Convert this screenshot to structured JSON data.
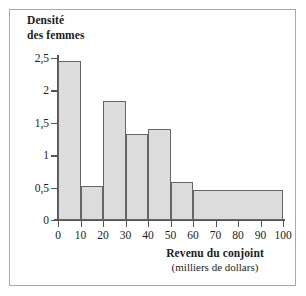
{
  "chart_data": {
    "type": "bar",
    "title": "",
    "subtitle": "",
    "ylabel": "Densité des femmes",
    "ylabel_lines": [
      "Densité",
      "des femmes"
    ],
    "xlabel": "Revenu du conjoint",
    "xlabel_sub": "(milliers de dollars)",
    "grid": false,
    "legend": null,
    "xlim": [
      0,
      100
    ],
    "ylim": [
      0,
      2.5
    ],
    "xticks": [
      0,
      10,
      20,
      30,
      40,
      50,
      60,
      70,
      80,
      90,
      100
    ],
    "xtick_labels": [
      "0",
      "10",
      "20",
      "30",
      "40",
      "50",
      "60",
      "70",
      "80",
      "90",
      "100"
    ],
    "yticks": [
      0,
      0.5,
      1,
      1.5,
      2,
      2.5
    ],
    "ytick_labels": [
      "0",
      "0,5",
      "1",
      "1,5",
      "2",
      "2,5"
    ],
    "bin_edges": [
      0,
      10,
      20,
      30,
      40,
      50,
      60,
      100
    ],
    "bars": [
      {
        "label": "0-10",
        "x0": 0,
        "x1": 10,
        "value": 2.45
      },
      {
        "label": "10-20",
        "x0": 10,
        "x1": 20,
        "value": 0.52
      },
      {
        "label": "20-30",
        "x0": 20,
        "x1": 30,
        "value": 1.84
      },
      {
        "label": "30-40",
        "x0": 30,
        "x1": 40,
        "value": 1.33
      },
      {
        "label": "40-50",
        "x0": 40,
        "x1": 50,
        "value": 1.41
      },
      {
        "label": "50-60",
        "x0": 50,
        "x1": 60,
        "value": 0.58
      },
      {
        "label": "60-100",
        "x0": 60,
        "x1": 100,
        "value": 0.46
      }
    ],
    "values": [
      2.45,
      0.52,
      1.84,
      1.33,
      1.41,
      0.58,
      0.46
    ],
    "categories": [
      "0-10",
      "10-20",
      "20-30",
      "30-40",
      "40-50",
      "50-60",
      "60-100"
    ],
    "colors": {
      "bar_fill": "#dcdcdc",
      "bar_border": "#666666",
      "axis": "#555555",
      "text": "#1c1c1c",
      "frame": "#a9a9a9",
      "background": "#ffffff"
    }
  }
}
